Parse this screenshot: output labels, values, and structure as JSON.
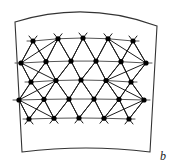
{
  "figure": {
    "label": "b",
    "domain_outline": {
      "name": "curved-quadrilateral-boundary",
      "stroke": "#333333",
      "stroke_width": 1.1,
      "fill": "#ffffff",
      "corners": {
        "top_left": [
          15,
          22
        ],
        "top_right": [
          157,
          26
        ],
        "bottom_right": [
          150,
          152
        ],
        "bottom_left": [
          22,
          152
        ]
      },
      "top_edge_bulge": -12,
      "bottom_edge_bulge": -4
    },
    "mesh": {
      "node_color": "#000000",
      "node_radius": 2.6,
      "edge_color": "#1a1a1a",
      "edge_width": 1.0,
      "horizontal_edge_color": "#555555",
      "row_count": 5,
      "nodes_per_row": [
        5,
        6,
        5,
        6,
        5
      ],
      "rows": [
        {
          "y": 41,
          "bow": -3,
          "x": [
            33,
            58,
            83,
            108,
            133
          ]
        },
        {
          "y": 63,
          "bow": -2,
          "x": [
            21,
            46,
            71,
            96,
            121,
            146
          ]
        },
        {
          "y": 82,
          "bow": -2,
          "x": [
            31,
            56,
            81,
            106,
            131
          ]
        },
        {
          "y": 100,
          "bow": -1,
          "x": [
            19,
            44,
            69,
            94,
            119,
            144
          ]
        },
        {
          "y": 119,
          "bow": -1,
          "x": [
            29,
            54,
            79,
            104,
            129
          ]
        }
      ]
    }
  },
  "colors": {
    "background": "#ffffff",
    "ink": "#000000",
    "outline": "#333333"
  }
}
